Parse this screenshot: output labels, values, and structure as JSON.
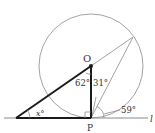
{
  "diagram": {
    "type": "geometry",
    "points": {
      "O": {
        "label": "O",
        "x": 91,
        "y": 66
      },
      "P": {
        "label": "P",
        "x": 91,
        "y": 118
      },
      "A": {
        "x": 16,
        "y": 118
      },
      "Q": {
        "x": 133,
        "y": 37
      }
    },
    "circle": {
      "cx": 91,
      "cy": 66,
      "r": 52
    },
    "line": {
      "label": "l"
    },
    "angles": {
      "x": "x°",
      "angle_at_O": "62°",
      "angle_at_P_upper": "31°",
      "angle_tangent": "59°"
    },
    "colors": {
      "thick_stroke": "#1a1a1a",
      "thin_stroke": "#8a8a8a",
      "text": "#333333"
    }
  }
}
